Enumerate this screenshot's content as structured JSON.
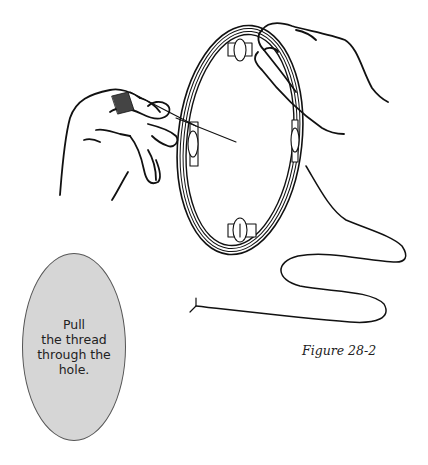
{
  "figure": {
    "label": "Figure 28-2",
    "illustration": "hands holding an embroidery hoop, one hand pulling a threaded needle through a hole in the hoop fabric, loose thread trailing below"
  },
  "callout": {
    "lines": [
      "Pull",
      "the thread",
      "through the",
      "hole."
    ],
    "fill_color": "#d6d6d6",
    "border_color": "#555555"
  },
  "colors": {
    "ink": "#111111",
    "background": "#ffffff"
  }
}
